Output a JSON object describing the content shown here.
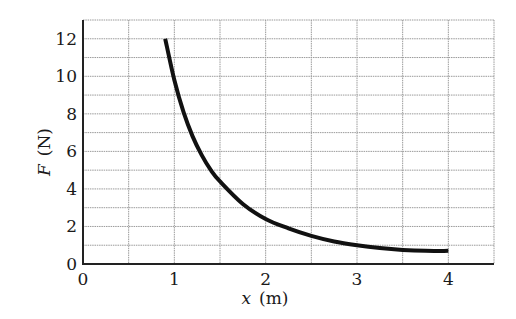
{
  "chart_data": {
    "type": "line",
    "title": "",
    "xlabel": "x (m)",
    "ylabel": "F (N)",
    "xlabel_var": "x",
    "xlabel_unit": "(m)",
    "ylabel_var": "F",
    "ylabel_unit": "(N)",
    "xlim": [
      0,
      4.5
    ],
    "ylim": [
      0,
      13
    ],
    "grid": true,
    "grid_minor_x": 0.5,
    "grid_minor_y": 1,
    "legend": "none",
    "x_ticks": [
      0,
      1,
      2,
      3,
      4
    ],
    "x_tick_labels": [
      "0",
      "1",
      "2",
      "3",
      "4"
    ],
    "y_ticks": [
      0,
      2,
      4,
      6,
      8,
      10,
      12
    ],
    "y_tick_labels": [
      "0",
      "2",
      "4",
      "6",
      "8",
      "10",
      "12"
    ],
    "series": [
      {
        "name": "F(x)",
        "x": [
          0.9,
          1.0,
          1.1,
          1.2,
          1.3,
          1.4,
          1.5,
          1.75,
          2.0,
          2.25,
          2.5,
          2.75,
          3.0,
          3.25,
          3.5,
          3.75,
          4.0
        ],
        "y": [
          12.0,
          9.8,
          8.1,
          6.8,
          5.8,
          5.0,
          4.4,
          3.2,
          2.4,
          1.9,
          1.5,
          1.2,
          1.0,
          0.85,
          0.75,
          0.7,
          0.7
        ]
      }
    ],
    "colors": {
      "curve": "#111111",
      "grid": "#9a9a9a",
      "axis": "#222222"
    }
  }
}
